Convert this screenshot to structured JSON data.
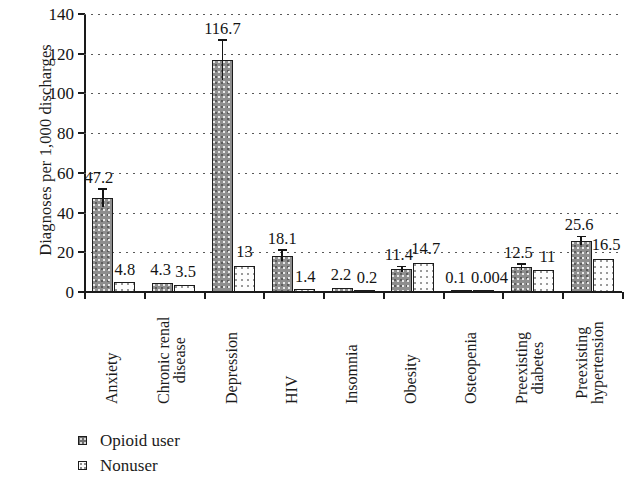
{
  "chart_data": {
    "type": "bar",
    "title": "",
    "xlabel": "",
    "ylabel": "Diagnoses per 1,000 discharges",
    "ylim": [
      0,
      140
    ],
    "yticks": [
      0,
      20,
      40,
      60,
      80,
      100,
      120,
      140
    ],
    "grid": true,
    "legend_position": "bottom-left",
    "categories": [
      "Anxiety",
      "Chronic renal disease",
      "Depression",
      "HIV",
      "Insomnia",
      "Obesity",
      "Osteopenia",
      "Preexisting diabetes",
      "Preexisting hypertension"
    ],
    "category_lines": [
      [
        "Anxiety"
      ],
      [
        "Chronic renal",
        "disease"
      ],
      [
        "Depression"
      ],
      [
        "HIV"
      ],
      [
        "Insomnia"
      ],
      [
        "Obesity"
      ],
      [
        "Osteopenia"
      ],
      [
        "Preexisting",
        "diabetes"
      ],
      [
        "Preexisting",
        "hypertension"
      ]
    ],
    "series": [
      {
        "name": "Opioid user",
        "values": [
          47.2,
          4.3,
          116.7,
          18.1,
          2.2,
          11.4,
          0.1,
          12.5,
          25.6
        ],
        "labels": [
          "47.2",
          "4.3",
          "116.7",
          "18.1",
          "2.2",
          "11.4",
          "0.1",
          "12.5",
          "25.6"
        ],
        "errors": [
          4.2,
          0.8,
          9.8,
          2.6,
          0.5,
          1.1,
          0.05,
          1.2,
          2.0
        ]
      },
      {
        "name": "Nonuser",
        "values": [
          4.8,
          3.5,
          13.0,
          1.4,
          0.2,
          14.7,
          0.004,
          11.0,
          16.5
        ],
        "labels": [
          "4.8",
          "3.5",
          "13",
          "1.4",
          "0.2",
          "14.7",
          "0.004",
          "11",
          "16.5"
        ],
        "errors": [
          0.4,
          0.3,
          0.9,
          0.2,
          0.05,
          0.9,
          0.002,
          0.7,
          1.0
        ]
      }
    ]
  },
  "legend": {
    "items": [
      {
        "label": "Opioid user",
        "swatch": "dark-speckled-square"
      },
      {
        "label": "Nonuser",
        "swatch": "light-dotted-square"
      }
    ]
  }
}
